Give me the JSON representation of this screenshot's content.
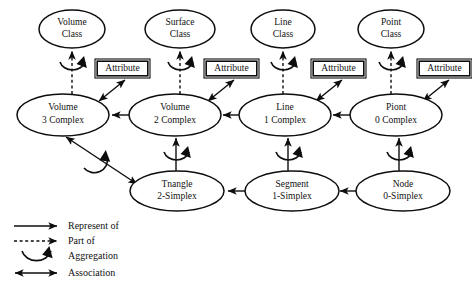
{
  "diagram": {
    "class_nodes": [
      {
        "id": "volume-class",
        "line1": "Volume",
        "line2": "Class",
        "cx": 72,
        "cy": 29,
        "rx": 33,
        "ry": 19
      },
      {
        "id": "surface-class",
        "line1": "Surface",
        "line2": "Class",
        "cx": 180,
        "cy": 29,
        "rx": 35,
        "ry": 19
      },
      {
        "id": "line-class",
        "line1": "Line",
        "line2": "Class",
        "cx": 283,
        "cy": 29,
        "rx": 32,
        "ry": 19
      },
      {
        "id": "point-class",
        "line1": "Point",
        "line2": "Class",
        "cx": 391,
        "cy": 29,
        "rx": 33,
        "ry": 19
      }
    ],
    "complex_nodes": [
      {
        "id": "volume-3-complex",
        "line1": "Volume",
        "line2": "3 Complex",
        "cx": 63,
        "cy": 115,
        "rx": 46,
        "ry": 21
      },
      {
        "id": "volume-2-complex",
        "line1": "Volume",
        "line2": "2 Complex",
        "cx": 175,
        "cy": 115,
        "rx": 46,
        "ry": 21
      },
      {
        "id": "line-1-complex",
        "line1": "Line",
        "line2": "1 Complex",
        "cx": 285,
        "cy": 115,
        "rx": 46,
        "ry": 21
      },
      {
        "id": "piont-0-complex",
        "line1": "Piont",
        "line2": "0 Complex",
        "cx": 396,
        "cy": 115,
        "rx": 46,
        "ry": 21
      }
    ],
    "simplex_nodes": [
      {
        "id": "tnangle-2-simplex",
        "line1": "Tnangle",
        "line2": "2-Simplex",
        "cx": 177,
        "cy": 191,
        "rx": 47,
        "ry": 20
      },
      {
        "id": "segment-1-simplex",
        "line1": "Segment",
        "line2": "1-Simplex",
        "cx": 292,
        "cy": 191,
        "rx": 47,
        "ry": 20
      },
      {
        "id": "node-0-simplex",
        "line1": "Node",
        "line2": "0-Simplex",
        "cx": 403,
        "cy": 191,
        "rx": 47,
        "ry": 20
      }
    ],
    "attribute_boxes": [
      {
        "id": "attribute-box-1",
        "label": "Attribute",
        "x": 95,
        "y": 59,
        "w": 55,
        "h": 19
      },
      {
        "id": "attribute-box-2",
        "label": "Attribute",
        "x": 204,
        "y": 59,
        "w": 55,
        "h": 19
      },
      {
        "id": "attribute-box-3",
        "label": "Attribute",
        "x": 311,
        "y": 59,
        "w": 55,
        "h": 19
      },
      {
        "id": "attribute-box-4",
        "label": "Attribute",
        "x": 417,
        "y": 59,
        "w": 55,
        "h": 19
      }
    ],
    "legend": {
      "items": [
        {
          "id": "legend-represent-of",
          "symbol": "solid-arrow",
          "label": "Represent of"
        },
        {
          "id": "legend-part-of",
          "symbol": "dashed-arrow",
          "label": "Part of"
        },
        {
          "id": "legend-aggregation",
          "symbol": "aggregation-arc",
          "label": "Aggregation"
        },
        {
          "id": "legend-association",
          "symbol": "double-arrow",
          "label": "Association"
        }
      ]
    },
    "caption": "",
    "colors": {
      "ink": "#0d0d0d",
      "background": "#ffffff"
    }
  }
}
